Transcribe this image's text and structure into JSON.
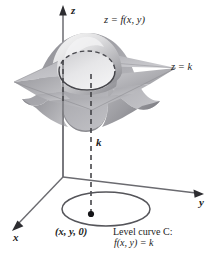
{
  "figure": {
    "background_color": "#ffffff",
    "width": 222,
    "height": 256
  },
  "axes": {
    "origin": {
      "x": 63,
      "y": 177
    },
    "z_label": "z",
    "y_label": "y",
    "x_label": "x",
    "color": "#6b6b70"
  },
  "labels": {
    "surface": "z = f(x, y)",
    "plane": "z = k",
    "height_k": "k",
    "point": "(x, y, 0)",
    "level_curve_line1": "Level curve C:",
    "level_curve_line2": "f(x, y) = k"
  },
  "colors": {
    "surface_light": "#e8e8e8",
    "surface_mid": "#c0c0c2",
    "surface_dark": "#8e8e92",
    "surface_darkest": "#6e6e73",
    "plane_fill": "#a8a8ac",
    "plane_fill_light": "#c4c4c8",
    "curve_stroke": "#55555a",
    "axis_stroke": "#6b6b70",
    "dash_stroke": "#3a3a3e",
    "text": "#1c1c1c"
  },
  "elements": {
    "surface_name": "bell-surface",
    "plane_name": "horizontal-plane-z-equals-k",
    "intersection_curve_name": "intersection-ellipse",
    "level_curve_name": "level-curve-ellipse",
    "drop_line_name": "dashed-drop-line",
    "point_marker_name": "point-marker"
  }
}
